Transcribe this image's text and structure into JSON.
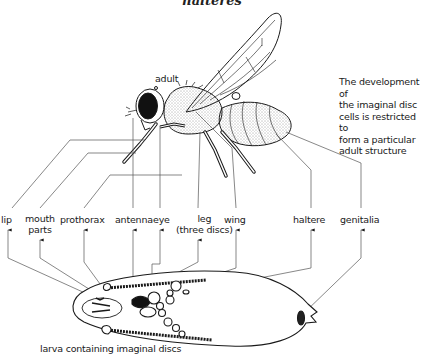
{
  "figure": {
    "title": "halteres",
    "adult_label": "adult",
    "note": "The development of\nthe imaginal disc\ncells is restricted to\nform a particular\nadult structure",
    "caption": "larva containing imaginal discs"
  },
  "structures": [
    {
      "id": "lip",
      "label": "lip"
    },
    {
      "id": "mouth-parts",
      "label": "mouth\nparts"
    },
    {
      "id": "prothorax",
      "label": "prothorax"
    },
    {
      "id": "antenna",
      "label": "antenna"
    },
    {
      "id": "eye",
      "label": "eye"
    },
    {
      "id": "leg",
      "label": "leg\n(three discs)"
    },
    {
      "id": "wing",
      "label": "wing"
    },
    {
      "id": "haltere",
      "label": "haltere"
    },
    {
      "id": "genitalia",
      "label": "genitalia"
    }
  ],
  "colors": {
    "ink": "#1a1a1a",
    "leader_line": "#555555",
    "background": "#ffffff"
  }
}
